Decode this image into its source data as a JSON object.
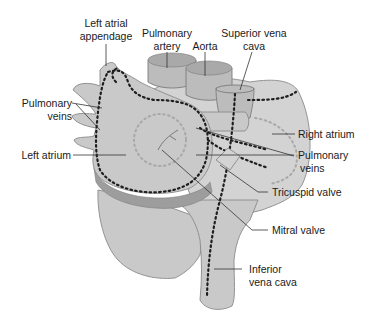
{
  "figure": {
    "colors": {
      "tissue": "#c9c9c9",
      "tissue_light": "#d3d3d3",
      "band": "#9d9d9d",
      "dotted_outline": "#1e1e1e",
      "text": "#1a1a1a",
      "background": "#ffffff"
    },
    "labels": {
      "left_atrial_appendage_1": "Left atrial",
      "left_atrial_appendage_2": "appendage",
      "pulmonary_artery_1": "Pulmonary",
      "pulmonary_artery_2": "artery",
      "aorta": "Aorta",
      "superior_vena_cava_1": "Superior vena",
      "superior_vena_cava_2": "cava",
      "pulmonary_veins_left_1": "Pulmonary",
      "pulmonary_veins_left_2": "veins",
      "left_atrium": "Left atrium",
      "right_atrium": "Right atrium",
      "pulmonary_veins_right_1": "Pulmonary",
      "pulmonary_veins_right_2": "veins",
      "tricuspid_valve": "Tricuspid valve",
      "mitral_valve": "Mitral valve",
      "inferior_vena_cava_1": "Inferior",
      "inferior_vena_cava_2": "vena cava"
    }
  }
}
